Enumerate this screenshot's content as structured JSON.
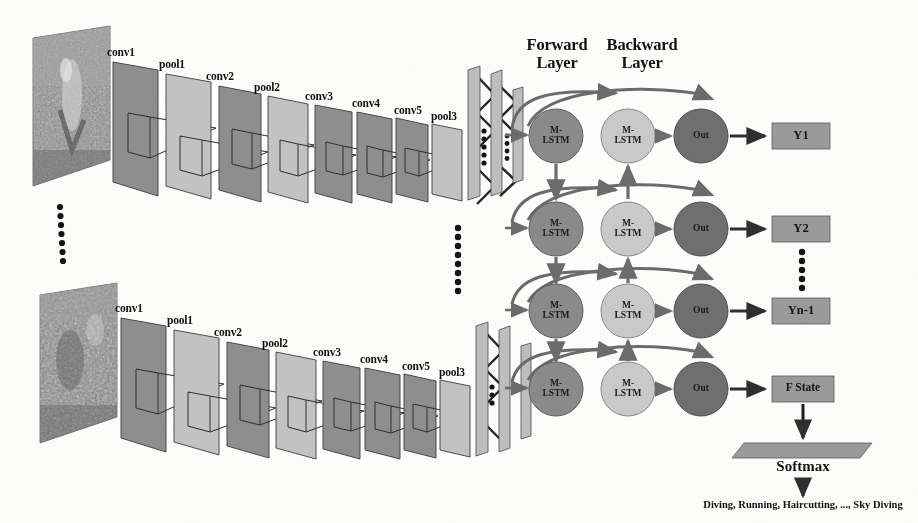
{
  "figure": {
    "type": "neural-network-architecture-diagram",
    "title_text": ""
  },
  "cnn": {
    "layer_labels": [
      "conv1",
      "pool1",
      "conv2",
      "pool2",
      "conv3",
      "conv4",
      "conv5",
      "pool3"
    ],
    "branches": [
      {
        "name": "top-branch",
        "input_frame_alt": "video frame"
      },
      {
        "name": "bottom-branch",
        "input_frame_alt": "video frame"
      }
    ],
    "ellipsis": "vertical-dots",
    "colors": {
      "conv_plane": "#8e8e8e",
      "pool_plane": "#c2c2c2",
      "outline": "#3d3d3d"
    }
  },
  "fc": {
    "name": "fully-connected-block",
    "bar_count": 3,
    "ellipsis": "vertical-dots",
    "color": "#bdbdbd"
  },
  "rnn": {
    "headers": [
      {
        "line1": "Forward",
        "line2": "Layer"
      },
      {
        "line1": "Backward",
        "line2": "Layer"
      }
    ],
    "forward_label": "M-\nLSTM",
    "backward_label": "M-\nLSTM",
    "out_label": "Out",
    "rows": [
      {
        "output": "Y1"
      },
      {
        "output": "Y2"
      },
      {
        "output": "Yn-1"
      },
      {
        "output": "F State"
      }
    ],
    "row_ellipsis": "vertical-dots",
    "colors": {
      "forward": "#8a8a8a",
      "backward": "#c9c9c9",
      "out": "#6f6f6f",
      "ybox": "#9a9a9a",
      "arrow": "#4a4a4a"
    }
  },
  "output": {
    "softmax_label": "Softmax",
    "classes_label": "Diving, Running, Haircutting, ..., Sky Diving",
    "softmax_color": "#9a9a9a"
  }
}
